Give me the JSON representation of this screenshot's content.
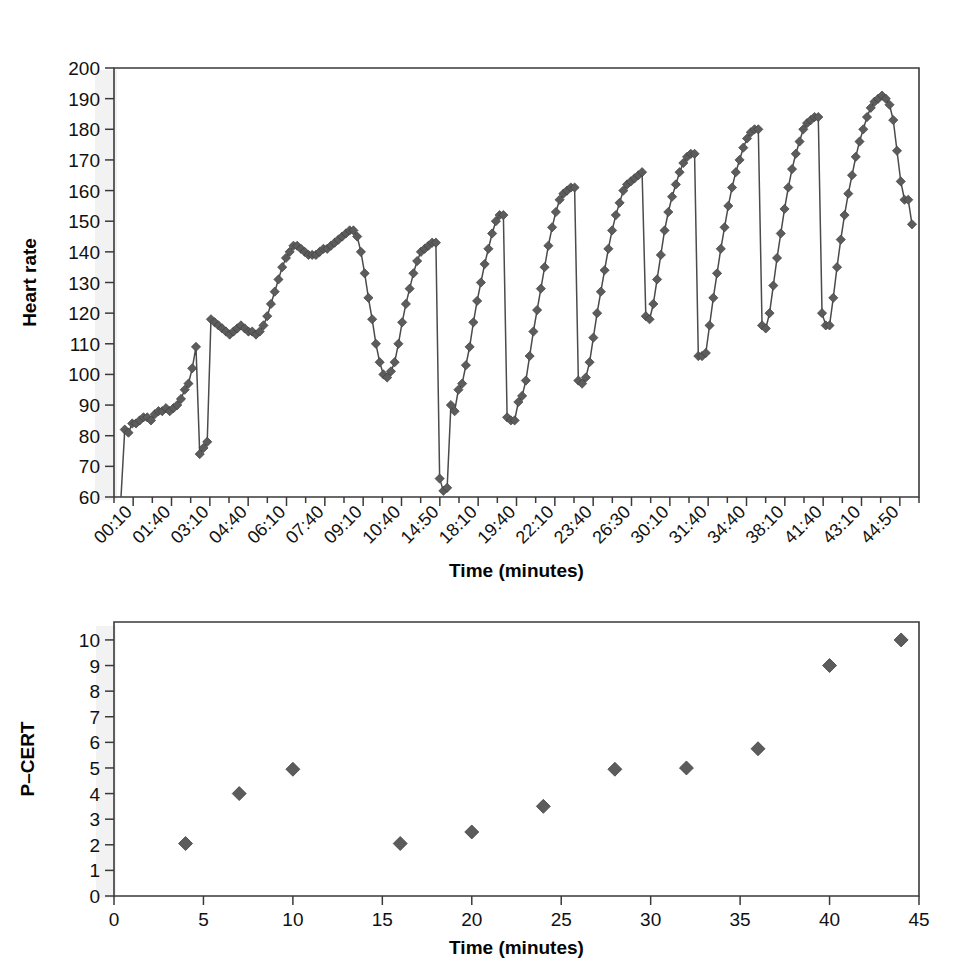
{
  "figure": {
    "background": "#ffffff",
    "marker_color": "#5c5c5c",
    "line_color": "#4b4b4b",
    "axis_color": "#3a3a3a"
  },
  "chart_data": [
    {
      "type": "line",
      "panel": "top",
      "title": "",
      "xlabel": "Time (minutes)",
      "ylabel": "Heart rate",
      "ylim": [
        60,
        200
      ],
      "ytick_labels": [
        "60",
        "70",
        "80",
        "90",
        "100",
        "110",
        "120",
        "130",
        "140",
        "150",
        "160",
        "170",
        "180",
        "190",
        "200"
      ],
      "yticks": [
        60,
        70,
        80,
        90,
        100,
        110,
        120,
        130,
        140,
        150,
        160,
        170,
        180,
        190,
        200
      ],
      "xtick_labels": [
        "00:10",
        "01:40",
        "03:10",
        "04:40",
        "06:10",
        "07:40",
        "09:10",
        "10:40",
        "14:50",
        "18:10",
        "19:40",
        "22:10",
        "23:40",
        "26:30",
        "30:10",
        "31:40",
        "34:40",
        "38:10",
        "41:40",
        "43:10",
        "44:50"
      ],
      "grid": false,
      "legend": "none",
      "marker": "diamond",
      "values": [
        60,
        82,
        81,
        84,
        84,
        85,
        86,
        86,
        85,
        87,
        88,
        88,
        89,
        88,
        89,
        90,
        92,
        95,
        97,
        102,
        109,
        74,
        76,
        78,
        118,
        117,
        116,
        115,
        114,
        113,
        114,
        115,
        116,
        115,
        114,
        114,
        113,
        114,
        116,
        119,
        123,
        127,
        131,
        135,
        138,
        140,
        142,
        142,
        141,
        140,
        139,
        139,
        139,
        140,
        141,
        141,
        142,
        143,
        144,
        145,
        146,
        147,
        147,
        145,
        140,
        133,
        125,
        118,
        110,
        104,
        100,
        99,
        101,
        104,
        110,
        117,
        123,
        128,
        133,
        137,
        140,
        141,
        142,
        143,
        143,
        66,
        62,
        63,
        90,
        88,
        95,
        97,
        103,
        109,
        117,
        124,
        130,
        136,
        141,
        146,
        150,
        152,
        152,
        86,
        85,
        85,
        91,
        93,
        98,
        106,
        114,
        121,
        128,
        135,
        142,
        148,
        153,
        157,
        159,
        160,
        161,
        161,
        98,
        97,
        99,
        104,
        112,
        120,
        127,
        134,
        141,
        147,
        152,
        156,
        160,
        162,
        163,
        164,
        165,
        166,
        119,
        118,
        123,
        131,
        139,
        147,
        153,
        158,
        162,
        166,
        169,
        171,
        172,
        172,
        106,
        106,
        107,
        116,
        125,
        133,
        141,
        148,
        155,
        161,
        166,
        170,
        174,
        177,
        179,
        180,
        180,
        116,
        115,
        120,
        129,
        138,
        146,
        154,
        161,
        167,
        172,
        176,
        180,
        182,
        183,
        184,
        184,
        120,
        116,
        116,
        125,
        135,
        144,
        152,
        159,
        165,
        171,
        176,
        180,
        184,
        187,
        189,
        190,
        191,
        190,
        188,
        183,
        173,
        163,
        157,
        157,
        149
      ]
    },
    {
      "type": "scatter",
      "panel": "bottom",
      "title": "",
      "xlabel": "Time (minutes)",
      "ylabel": "P–CERT",
      "xlim": [
        0,
        45
      ],
      "ylim": [
        0,
        10.7
      ],
      "xtick_labels": [
        "0",
        "5",
        "10",
        "15",
        "20",
        "25",
        "30",
        "35",
        "40",
        "45"
      ],
      "xticks": [
        0,
        5,
        10,
        15,
        20,
        25,
        30,
        35,
        40,
        45
      ],
      "ytick_labels": [
        "0",
        "1",
        "2",
        "3",
        "4",
        "5",
        "6",
        "7",
        "8",
        "9",
        "10"
      ],
      "yticks": [
        0,
        1,
        2,
        3,
        4,
        5,
        6,
        7,
        8,
        9,
        10
      ],
      "grid": false,
      "legend": "none",
      "marker": "diamond",
      "points": [
        {
          "x": 4,
          "y": 2.05
        },
        {
          "x": 7,
          "y": 4.0
        },
        {
          "x": 10,
          "y": 4.95
        },
        {
          "x": 16,
          "y": 2.05
        },
        {
          "x": 20,
          "y": 2.5
        },
        {
          "x": 24,
          "y": 3.5
        },
        {
          "x": 28,
          "y": 4.95
        },
        {
          "x": 32,
          "y": 5.0
        },
        {
          "x": 36,
          "y": 5.75
        },
        {
          "x": 40,
          "y": 9.0
        },
        {
          "x": 44,
          "y": 10.0
        }
      ]
    }
  ]
}
